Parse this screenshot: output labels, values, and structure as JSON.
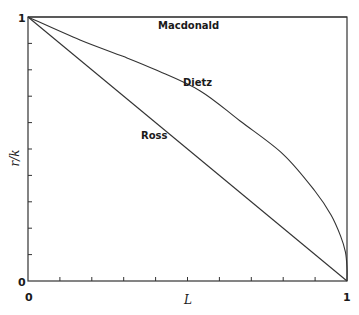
{
  "chart_data": {
    "type": "line",
    "title": "",
    "xlabel": "L",
    "ylabel": "r/k",
    "xlim": [
      0,
      1
    ],
    "ylim": [
      0,
      1
    ],
    "x_tick_labels": [
      "0",
      "1"
    ],
    "y_tick_labels": [
      "0",
      "1"
    ],
    "x_minor_ticks": 10,
    "y_minor_ticks": 10,
    "grid": false,
    "legend": "inline labels",
    "series": [
      {
        "name": "Macdonald",
        "x": [
          0,
          1
        ],
        "y": [
          1,
          1
        ]
      },
      {
        "name": "Dietz",
        "x": [
          0,
          0.163,
          0.3,
          0.4,
          0.54,
          0.665,
          0.8,
          0.9,
          0.95,
          0.98,
          0.995,
          1.0,
          1.0
        ],
        "y": [
          1,
          0.913,
          0.85,
          0.8,
          0.72,
          0.606,
          0.48,
          0.34,
          0.25,
          0.17,
          0.11,
          0.05,
          0
        ]
      },
      {
        "name": "Ross",
        "x": [
          0,
          1
        ],
        "y": [
          1,
          0
        ]
      }
    ],
    "annotations": [
      {
        "text": "Macdonald",
        "x": 0.45,
        "y": 0.97
      },
      {
        "text": "Dietz",
        "x": 0.54,
        "y": 0.76
      },
      {
        "text": "Ross",
        "x": 0.36,
        "y": 0.55
      }
    ]
  },
  "labels": {
    "x_axis": "L",
    "y_axis": "r/k",
    "x_min": "0",
    "x_max": "1",
    "y_min": "0",
    "y_max": "1",
    "macdonald": "Macdonald",
    "dietz": "Dietz",
    "ross": "Ross"
  }
}
